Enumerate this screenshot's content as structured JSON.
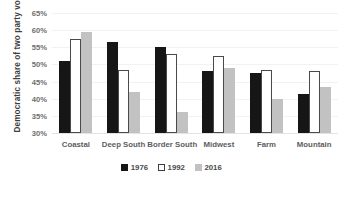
{
  "chart_data": {
    "type": "bar",
    "title": "",
    "xlabel": "",
    "ylabel": "Democratic share of two party vote",
    "ylim": [
      30,
      65
    ],
    "ytick_step": 5,
    "ytick_labels": [
      "65%",
      "60%",
      "55%",
      "50%",
      "45%",
      "40%",
      "35%",
      "30%"
    ],
    "ytick_values": [
      65,
      60,
      55,
      50,
      45,
      40,
      35,
      30
    ],
    "grid": true,
    "legend_position": "bottom",
    "categories": [
      "Coastal",
      "Deep South",
      "Border South",
      "Midwest",
      "Farm",
      "Mountain"
    ],
    "series": [
      {
        "name": "1976",
        "color": "#161616",
        "values": [
          51.0,
          56.5,
          55.0,
          48.0,
          47.5,
          41.5
        ]
      },
      {
        "name": "1992",
        "color": "#ffffff",
        "values": [
          57.5,
          48.5,
          53.0,
          52.5,
          48.5,
          48.0
        ]
      },
      {
        "name": "2016",
        "color": "#c2c2c2",
        "values": [
          59.5,
          42.0,
          36.0,
          49.0,
          40.0,
          43.5
        ]
      }
    ]
  },
  "axis": {
    "y_title": "Democratic share of two party vote"
  },
  "legend": {
    "items": [
      {
        "label": "1976",
        "swatch": "filled-black-square-icon"
      },
      {
        "label": "1992",
        "swatch": "outlined-white-square-icon"
      },
      {
        "label": "2016",
        "swatch": "filled-gray-square-icon"
      }
    ]
  }
}
